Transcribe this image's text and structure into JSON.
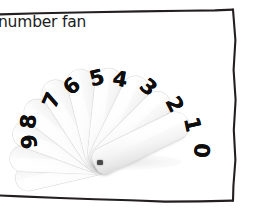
{
  "page": {
    "background_color": "#ffffff",
    "width": 255,
    "height": 213
  },
  "caption": {
    "text": "number fan"
  },
  "frame": {
    "stroke_color": "#231f20",
    "style": "hand-drawn-rectangle",
    "left_edge_visible": false
  },
  "fan": {
    "description": "white plastic number fan with ten numbered blades",
    "pivot": {
      "x": 100,
      "y": 162
    },
    "blade_color": "#ffffff",
    "blade_edge_color": "#d8d8d8",
    "digit_color": "#100d0d",
    "blades": [
      {
        "label": "9",
        "angle": -103,
        "length": 92,
        "width": 25,
        "digit_x": 15,
        "digit_y": 131,
        "digit_rotate": -97
      },
      {
        "label": "8",
        "angle": -88,
        "length": 96,
        "width": 25,
        "digit_x": 14,
        "digit_y": 111,
        "digit_rotate": -84
      },
      {
        "label": "7",
        "angle": -70,
        "length": 98,
        "width": 25,
        "digit_x": 37,
        "digit_y": 90,
        "digit_rotate": -66
      },
      {
        "label": "6",
        "angle": -52,
        "length": 99,
        "width": 25,
        "digit_x": 57,
        "digit_y": 76,
        "digit_rotate": -42
      },
      {
        "label": "5",
        "angle": -33,
        "length": 101,
        "width": 26,
        "digit_x": 82,
        "digit_y": 68,
        "digit_rotate": -14
      },
      {
        "label": "4",
        "angle": -14,
        "length": 101,
        "width": 26,
        "digit_x": 105,
        "digit_y": 69,
        "digit_rotate": 10
      },
      {
        "label": "3",
        "angle": 6,
        "length": 100,
        "width": 26,
        "digit_x": 133,
        "digit_y": 77,
        "digit_rotate": 42
      },
      {
        "label": "2",
        "angle": 26,
        "length": 100,
        "width": 26,
        "digit_x": 159,
        "digit_y": 94,
        "digit_rotate": 63
      },
      {
        "label": "1",
        "angle": 45,
        "length": 100,
        "width": 26,
        "digit_x": 177,
        "digit_y": 114,
        "digit_rotate": 78
      },
      {
        "label": "0",
        "angle": 64,
        "length": 103,
        "width": 27,
        "digit_x": 186,
        "digit_y": 140,
        "digit_rotate": 92
      }
    ]
  }
}
